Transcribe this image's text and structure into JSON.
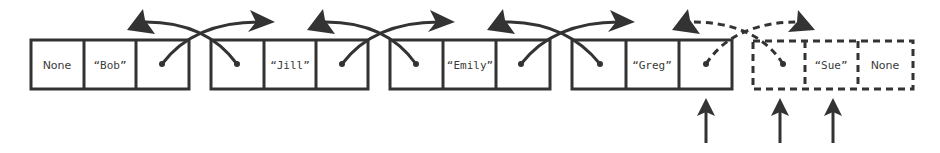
{
  "diagram": {
    "colors": {
      "stroke": "#333333",
      "text": "#3a3a3a",
      "background": "#ffffff"
    },
    "nodes": [
      {
        "prev": "None",
        "value": "“Bob”",
        "next": "",
        "style": "solid"
      },
      {
        "prev": "",
        "value": "“Jill”",
        "next": "",
        "style": "solid"
      },
      {
        "prev": "",
        "value": "“Emily”",
        "next": "",
        "style": "solid"
      },
      {
        "prev": "",
        "value": "“Greg”",
        "next": "",
        "style": "solid"
      },
      {
        "prev": "",
        "value": "“Sue”",
        "next": "None",
        "style": "dashed"
      }
    ],
    "links": [
      {
        "from": "Bob.next",
        "to": "Jill",
        "style": "solid"
      },
      {
        "from": "Jill.prev",
        "to": "Bob",
        "style": "solid"
      },
      {
        "from": "Jill.next",
        "to": "Emily",
        "style": "solid"
      },
      {
        "from": "Emily.prev",
        "to": "Jill",
        "style": "solid"
      },
      {
        "from": "Emily.next",
        "to": "Greg",
        "style": "solid"
      },
      {
        "from": "Greg.prev",
        "to": "Emily",
        "style": "solid"
      },
      {
        "from": "Greg.next",
        "to": "Sue",
        "style": "dashed"
      },
      {
        "from": "Sue.prev",
        "to": "Greg",
        "style": "dashed"
      }
    ],
    "pointer_arrows": [
      {
        "target": "Greg.next"
      },
      {
        "target": "Sue.prev"
      },
      {
        "target": "Sue.value"
      }
    ]
  }
}
